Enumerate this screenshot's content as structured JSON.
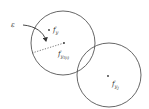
{
  "diagram": {
    "epsilon_label": "ε",
    "left_center_label": {
      "base": "f",
      "sub": "y",
      "subsub": "l"
    },
    "nearest_point_label": {
      "base": "f",
      "sub": "y",
      "subsub": "l(i)"
    },
    "right_center_label": {
      "base": "f",
      "sub": "y",
      "subsub": "j"
    },
    "colors": {
      "stroke": "#555555",
      "text": "#333333"
    }
  }
}
